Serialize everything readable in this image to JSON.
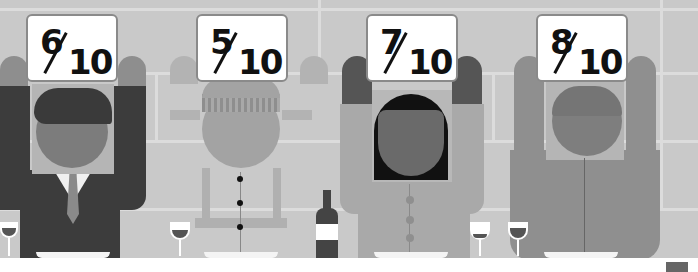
{
  "scene": {
    "description": "Four diners holding up score cards at a restaurant table",
    "palette": {
      "wall": "#c9c9c9",
      "wall_lines": "#dcdcdc",
      "table": "#ffffff",
      "sign_text": "#111111"
    }
  },
  "diners": [
    {
      "id": "suit-man",
      "score": "6",
      "out_of": "10",
      "outfit": "dark suit with tie"
    },
    {
      "id": "beanie-person",
      "score": "5",
      "out_of": "10",
      "outfit": "light faded jacket with buttons, beanie hat"
    },
    {
      "id": "bob-hair-woman",
      "score": "7",
      "out_of": "10",
      "outfit": "cardigan with buttons, black bob hair"
    },
    {
      "id": "cap-man",
      "score": "8",
      "out_of": "10",
      "outfit": "zip jacket with cap"
    }
  ],
  "props": [
    "wine-glass",
    "wine-glass",
    "wine-bottle",
    "wine-glass",
    "wine-glass",
    "wine-glass",
    "plates"
  ]
}
